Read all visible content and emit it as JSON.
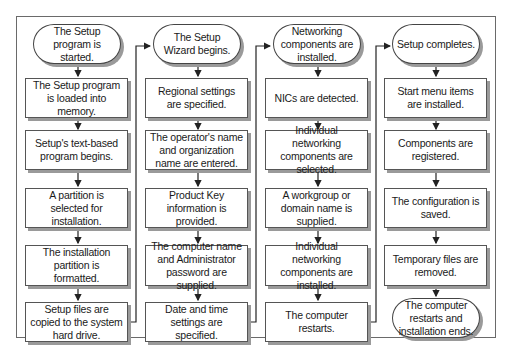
{
  "diagram": {
    "columns": [
      {
        "start": "The Setup program is started.",
        "steps": [
          "The Setup program is loaded into memory.",
          "Setup's text-based program begins.",
          "A partition is selected for installation.",
          "The installation partition is formatted.",
          "Setup files are copied to the system hard drive."
        ]
      },
      {
        "start": "The Setup Wizard begins.",
        "steps": [
          "Regional settings are specified.",
          "The operator's name and organization name are entered.",
          "Product Key information is provided.",
          "The computer name and Administrator password are supplied.",
          "Date and time settings are specified."
        ]
      },
      {
        "start": "Networking components are installed.",
        "steps": [
          "NICs are detected.",
          "Individual networking components are selected.",
          "A workgroup or domain name is supplied.",
          "Individual networking components are installed.",
          "The computer restarts."
        ]
      },
      {
        "start": "Setup completes.",
        "steps": [
          "Start menu items are installed.",
          "Components are registered.",
          "The configuration is saved.",
          "Temporary files are removed."
        ],
        "end": "The computer restarts and installation ends."
      }
    ],
    "colors": {
      "line": "#222222",
      "shadow": "#9a9a9a",
      "frame": "#6a6a6a"
    }
  }
}
